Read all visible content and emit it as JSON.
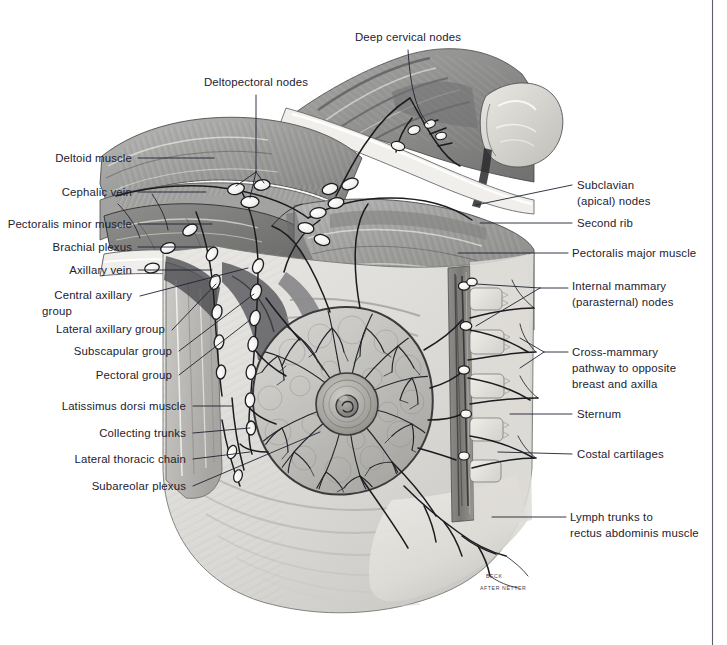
{
  "plate": {
    "title": "Lymphatic drainage of the breast and axilla",
    "signature_line1": "BECK",
    "signature_line2": "AFTER NETTER",
    "background_color": "#ffffff",
    "label_color": "#1c2230",
    "leader_color": "#1c2230",
    "page_rule_color": "#5a5f68"
  },
  "labels": {
    "top": [
      {
        "id": "deep-cervical-nodes",
        "text": "Deep cervical nodes",
        "x": 408,
        "y": 41,
        "anchor": "middle"
      },
      {
        "id": "deltopectoral-nodes",
        "text": "Deltopectoral nodes",
        "x": 256,
        "y": 86,
        "anchor": "middle"
      }
    ],
    "left": [
      {
        "id": "deltoid-muscle",
        "text": "Deltoid muscle",
        "x": 132,
        "y": 162
      },
      {
        "id": "cephalic-vein",
        "text": "Cephalic vein",
        "x": 132,
        "y": 196
      },
      {
        "id": "pectoralis-minor-muscle",
        "text": "Pectoralis minor muscle",
        "x": 132,
        "y": 228
      },
      {
        "id": "brachial-plexus",
        "text": "Brachial plexus",
        "x": 132,
        "y": 251
      },
      {
        "id": "axillary-vein",
        "text": "Axillary vein",
        "x": 132,
        "y": 274
      },
      {
        "id": "central-axillary-group-l1",
        "text": "Central axillary",
        "x": 132,
        "y": 299
      },
      {
        "id": "central-axillary-group-l2",
        "text": "group",
        "x": 132,
        "y": 315,
        "continuation": true
      },
      {
        "id": "lateral-axillary-group",
        "text": "Lateral axillary group",
        "x": 165,
        "y": 333
      },
      {
        "id": "subscapular-group",
        "text": "Subscapular group",
        "x": 172,
        "y": 355
      },
      {
        "id": "pectoral-group",
        "text": "Pectoral group",
        "x": 172,
        "y": 379
      },
      {
        "id": "latissimus-dorsi-muscle",
        "text": "Latissimus dorsi muscle",
        "x": 186,
        "y": 410
      },
      {
        "id": "collecting-trunks",
        "text": "Collecting trunks",
        "x": 186,
        "y": 437
      },
      {
        "id": "lateral-thoracic-chain",
        "text": "Lateral thoracic chain",
        "x": 186,
        "y": 463
      },
      {
        "id": "subareolar-plexus",
        "text": "Subareolar plexus",
        "x": 186,
        "y": 490
      }
    ],
    "right": [
      {
        "id": "subclavian-apical-nodes-l1",
        "text": "Subclavian",
        "x": 577,
        "y": 189
      },
      {
        "id": "subclavian-apical-nodes-l2",
        "text": "(apical) nodes",
        "x": 577,
        "y": 205,
        "continuation": true
      },
      {
        "id": "second-rib",
        "text": "Second rib",
        "x": 577,
        "y": 227
      },
      {
        "id": "pectoralis-major-muscle",
        "text": "Pectoralis major muscle",
        "x": 572,
        "y": 257
      },
      {
        "id": "internal-mammary-nodes-l1",
        "text": "Internal mammary",
        "x": 572,
        "y": 290
      },
      {
        "id": "internal-mammary-nodes-l2",
        "text": "(parasternal) nodes",
        "x": 572,
        "y": 306,
        "continuation": true
      },
      {
        "id": "cross-mammary-pathway-l1",
        "text": "Cross-mammary",
        "x": 572,
        "y": 356
      },
      {
        "id": "cross-mammary-pathway-l2",
        "text": "pathway to opposite",
        "x": 572,
        "y": 372,
        "continuation": true
      },
      {
        "id": "cross-mammary-pathway-l3",
        "text": "breast and axilla",
        "x": 572,
        "y": 388,
        "continuation": true
      },
      {
        "id": "sternum",
        "text": "Sternum",
        "x": 577,
        "y": 418
      },
      {
        "id": "costal-cartilages",
        "text": "Costal cartilages",
        "x": 577,
        "y": 458
      },
      {
        "id": "lymph-trunks-l1",
        "text": "Lymph trunks to",
        "x": 570,
        "y": 521
      },
      {
        "id": "lymph-trunks-l2",
        "text": "rectus abdominis muscle",
        "x": 570,
        "y": 537,
        "continuation": true
      }
    ]
  },
  "anatomy": {
    "regions": [
      {
        "id": "deltoid-muscle-region",
        "name": "deltoid muscle"
      },
      {
        "id": "pectoralis-major-region",
        "name": "pectoralis major muscle"
      },
      {
        "id": "pectoralis-minor-region",
        "name": "pectoralis minor muscle"
      },
      {
        "id": "latissimus-dorsi-region",
        "name": "latissimus dorsi muscle"
      },
      {
        "id": "neck-region",
        "name": "neck with deep cervical nodes"
      },
      {
        "id": "clavicle-region",
        "name": "clavicle"
      },
      {
        "id": "breast-region",
        "name": "breast with subareolar lymphatic plexus"
      },
      {
        "id": "nipple-areola-region",
        "name": "nipple and areola"
      },
      {
        "id": "sternum-region",
        "name": "sternum and costal cartilages"
      },
      {
        "id": "rectus-abdominis-region",
        "name": "rectus abdominis / abdominal wall"
      },
      {
        "id": "axilla-region",
        "name": "axilla with lymph node chains"
      }
    ],
    "node_chain_count": 6,
    "costal_cartilage_count": 5
  }
}
